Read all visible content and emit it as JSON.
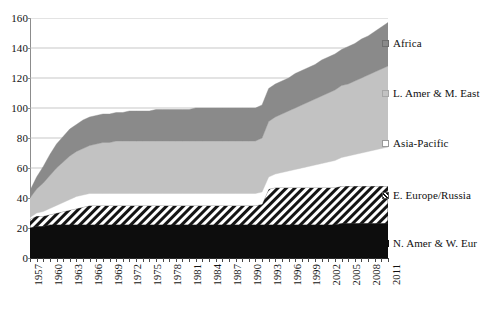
{
  "chart_data": {
    "type": "area",
    "title": "",
    "xlabel": "",
    "ylabel": "",
    "stacked": true,
    "grid": true,
    "legend_position": "right",
    "ylim": [
      0,
      160
    ],
    "yticks": [
      0,
      20,
      40,
      60,
      80,
      100,
      120,
      140,
      160
    ],
    "xtick_labels": [
      "1957",
      "1960",
      "1963",
      "1966",
      "1969",
      "1972",
      "1975",
      "1978",
      "1981",
      "1984",
      "1987",
      "1990",
      "1993",
      "1996",
      "1999",
      "2002",
      "2005",
      "2008",
      "2011"
    ],
    "x": [
      1957,
      1958,
      1959,
      1960,
      1961,
      1962,
      1963,
      1964,
      1965,
      1966,
      1967,
      1968,
      1969,
      1970,
      1971,
      1972,
      1973,
      1974,
      1975,
      1976,
      1977,
      1978,
      1979,
      1980,
      1981,
      1982,
      1983,
      1984,
      1985,
      1986,
      1987,
      1988,
      1989,
      1990,
      1991,
      1992,
      1993,
      1994,
      1995,
      1996,
      1997,
      1998,
      1999,
      2000,
      2001,
      2002,
      2003,
      2004,
      2005,
      2006,
      2007,
      2008,
      2009,
      2010,
      2011
    ],
    "series": [
      {
        "name": "N. Amer & W. Eur",
        "color": "#0d0d0d",
        "pattern": "solid",
        "values": [
          20,
          21,
          21,
          22,
          22,
          22,
          22,
          22,
          22,
          22,
          22,
          22,
          22,
          22,
          22,
          22,
          22,
          22,
          22,
          22,
          22,
          22,
          22,
          22,
          22,
          22,
          22,
          22,
          22,
          22,
          22,
          22,
          22,
          22,
          22,
          22,
          22,
          22,
          22,
          22,
          22,
          22,
          22,
          22,
          22,
          22,
          22,
          23,
          23,
          23,
          23,
          23,
          23,
          23,
          23
        ]
      },
      {
        "name": "E. Europe/Russia",
        "color": "#ffffff",
        "pattern": "diagonal-hatch",
        "values": [
          6,
          7,
          7,
          7,
          8,
          9,
          10,
          11,
          12,
          13,
          13,
          13,
          13,
          13,
          13,
          13,
          13,
          13,
          13,
          13,
          13,
          13,
          13,
          13,
          13,
          13,
          13,
          13,
          13,
          13,
          13,
          13,
          13,
          13,
          13,
          14,
          24,
          25,
          25,
          25,
          25,
          25,
          25,
          25,
          25,
          25,
          25,
          25,
          25,
          25,
          25,
          25,
          25,
          25,
          25
        ]
      },
      {
        "name": "Asia-Pacific",
        "color": "#ffffff",
        "pattern": "solid",
        "values": [
          1,
          2,
          3,
          4,
          5,
          6,
          7,
          8,
          8,
          8,
          8,
          8,
          8,
          8,
          8,
          8,
          8,
          8,
          8,
          8,
          8,
          8,
          8,
          8,
          8,
          8,
          8,
          8,
          8,
          8,
          8,
          8,
          8,
          8,
          8,
          8,
          8,
          9,
          10,
          11,
          12,
          13,
          14,
          15,
          16,
          17,
          18,
          19,
          20,
          21,
          22,
          23,
          24,
          25,
          26
        ]
      },
      {
        "name": "L. Amer & M. East",
        "color": "#c2c2c2",
        "pattern": "solid",
        "values": [
          13,
          16,
          19,
          22,
          25,
          27,
          29,
          30,
          31,
          32,
          33,
          34,
          34,
          35,
          35,
          35,
          35,
          35,
          35,
          35,
          35,
          35,
          35,
          35,
          35,
          35,
          35,
          35,
          35,
          35,
          35,
          35,
          35,
          35,
          35,
          36,
          37,
          38,
          39,
          40,
          41,
          42,
          43,
          44,
          45,
          46,
          47,
          48,
          48,
          49,
          50,
          51,
          52,
          53,
          54
        ]
      },
      {
        "name": "Africa",
        "color": "#8a8a8a",
        "pattern": "solid",
        "values": [
          5,
          8,
          11,
          14,
          16,
          17,
          18,
          18,
          19,
          19,
          19,
          19,
          19,
          19,
          19,
          20,
          20,
          20,
          20,
          21,
          21,
          21,
          21,
          21,
          21,
          22,
          22,
          22,
          22,
          22,
          22,
          22,
          22,
          22,
          22,
          22,
          22,
          22,
          22,
          22,
          23,
          23,
          23,
          23,
          24,
          24,
          24,
          24,
          25,
          25,
          26,
          26,
          27,
          28,
          29
        ]
      }
    ],
    "totals_note": [
      {
        "year": 1957,
        "total": 45
      },
      {
        "year": 1970,
        "total": 97
      },
      {
        "year": 1990,
        "total": 101
      },
      {
        "year": 1993,
        "total": 110
      },
      {
        "year": 2011,
        "total": 157
      }
    ]
  },
  "legend": {
    "items": [
      {
        "label": "Africa",
        "swatch": "sw-africa",
        "icon": "legend-swatch-africa"
      },
      {
        "label": "L. Amer & M. East",
        "swatch": "sw-lamer",
        "icon": "legend-swatch-latin-america-middle-east"
      },
      {
        "label": "Asia-Pacific",
        "swatch": "sw-asia",
        "icon": "legend-swatch-asia-pacific"
      },
      {
        "label": "E. Europe/Russia",
        "swatch": "sw-eeur",
        "icon": "legend-swatch-eastern-europe-russia"
      },
      {
        "label": "N. Amer & W. Eur",
        "swatch": "sw-namer",
        "icon": "legend-swatch-north-america-western-europe"
      }
    ]
  },
  "colors": {
    "africa": "#8a8a8a",
    "l_amer_m_east": "#c2c2c2",
    "asia_pacific": "#ffffff",
    "e_europe_russia": "#ffffff",
    "n_amer_w_eur": "#0d0d0d",
    "gridline": "#b9b9b9",
    "axis": "#2a2a2a"
  }
}
